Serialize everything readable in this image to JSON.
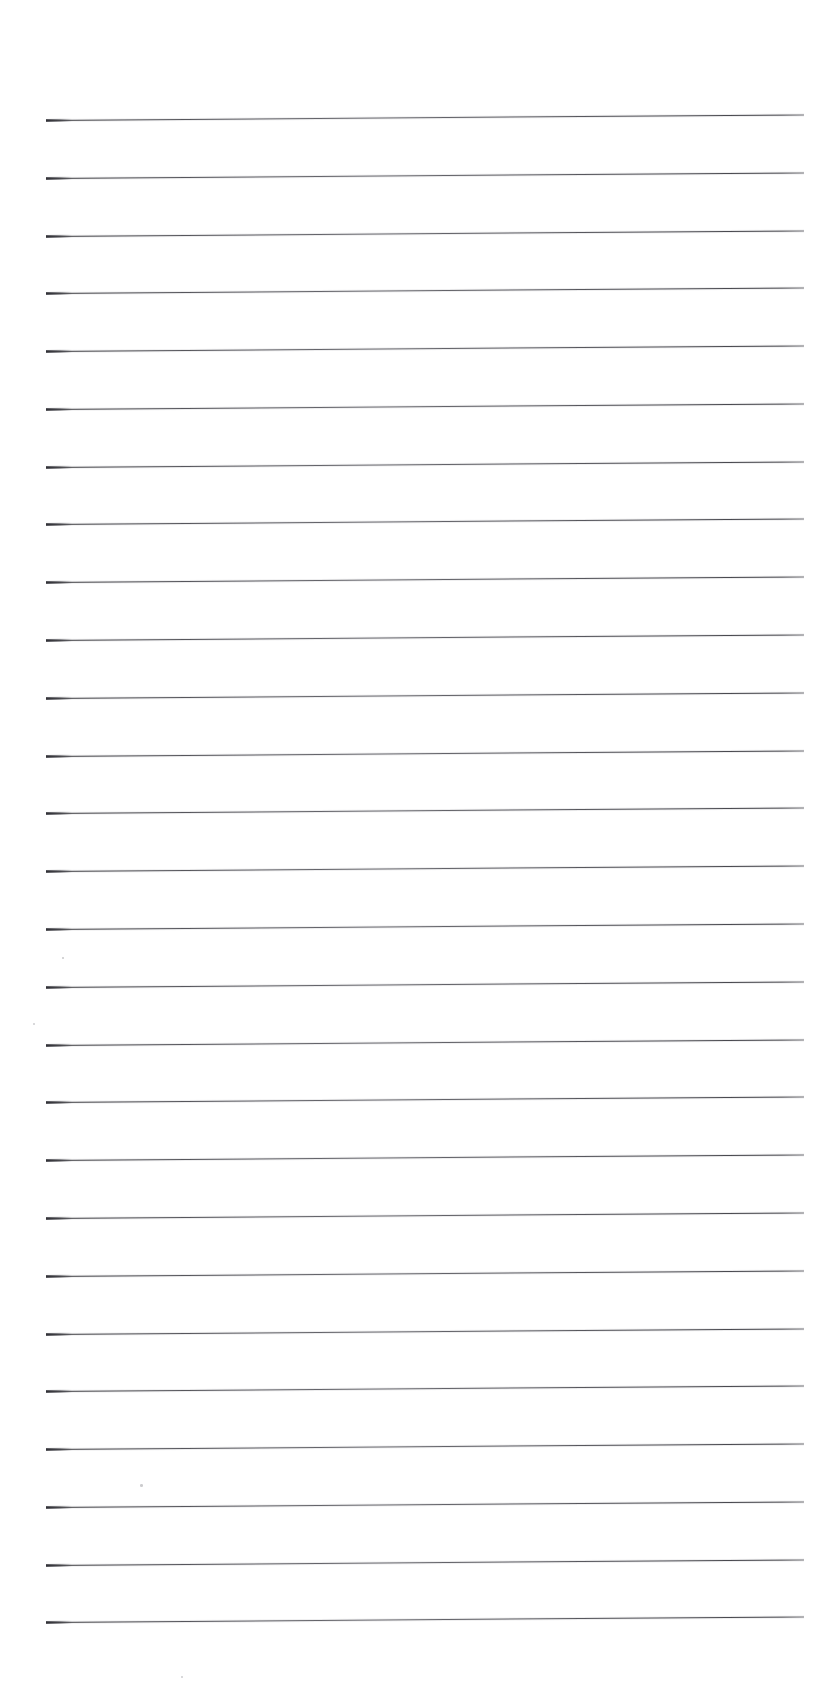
{
  "document": {
    "kind": "scanned-lined-paper",
    "title": "Blank ruled notebook page",
    "page_width": 840,
    "page_height": 1700,
    "background_color": "#ffffff",
    "ink_color": "#3a3a3e",
    "text_content": "",
    "written_content": "",
    "visible_text_count": 0
  },
  "ruling": {
    "line_count": 27,
    "line_left_x": 46,
    "line_right_x": 804,
    "line_length": 758,
    "first_line_y": 120,
    "last_line_y": 1622,
    "line_spacing": 57.8,
    "line_thickness": 1.3,
    "tilt_degrees": -0.42,
    "line_color": "#3f3f45"
  },
  "margins": {
    "top": 120,
    "bottom": 78,
    "left": 46,
    "right": 36
  },
  "lines": [
    {
      "index": 1,
      "y": 120
    },
    {
      "index": 2,
      "y": 178
    },
    {
      "index": 3,
      "y": 236
    },
    {
      "index": 4,
      "y": 293
    },
    {
      "index": 5,
      "y": 351
    },
    {
      "index": 6,
      "y": 409
    },
    {
      "index": 7,
      "y": 467
    },
    {
      "index": 8,
      "y": 524
    },
    {
      "index": 9,
      "y": 582
    },
    {
      "index": 10,
      "y": 640
    },
    {
      "index": 11,
      "y": 698
    },
    {
      "index": 12,
      "y": 756
    },
    {
      "index": 13,
      "y": 813
    },
    {
      "index": 14,
      "y": 871
    },
    {
      "index": 15,
      "y": 929
    },
    {
      "index": 16,
      "y": 987
    },
    {
      "index": 17,
      "y": 1045
    },
    {
      "index": 18,
      "y": 1102
    },
    {
      "index": 19,
      "y": 1160
    },
    {
      "index": 20,
      "y": 1218
    },
    {
      "index": 21,
      "y": 1276
    },
    {
      "index": 22,
      "y": 1334
    },
    {
      "index": 23,
      "y": 1391
    },
    {
      "index": 24,
      "y": 1449
    },
    {
      "index": 25,
      "y": 1507
    },
    {
      "index": 26,
      "y": 1565
    },
    {
      "index": 27,
      "y": 1622
    }
  ],
  "artifacts": [
    {
      "name": "scan-speck",
      "x": 33,
      "y": 1023,
      "size": 2.2
    },
    {
      "name": "scan-speck",
      "x": 140,
      "y": 1484,
      "size": 2.6
    },
    {
      "name": "scan-speck",
      "x": 181,
      "y": 1676,
      "size": 2.2
    },
    {
      "name": "scan-speck",
      "x": 62,
      "y": 957,
      "size": 1.6
    }
  ]
}
